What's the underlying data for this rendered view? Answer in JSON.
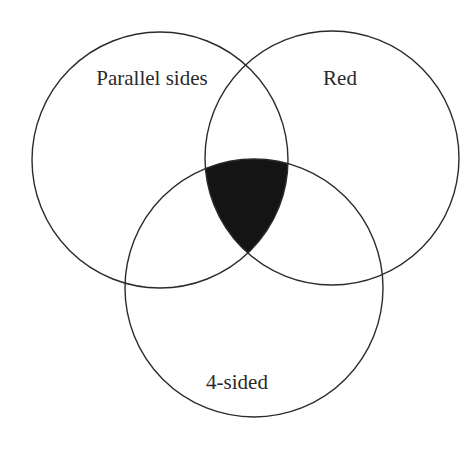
{
  "diagram": {
    "type": "venn",
    "sets": [
      {
        "id": "parallel",
        "label": "Parallel sides",
        "cx": 160,
        "cy": 160,
        "r": 128,
        "label_x": 152,
        "label_y": 85
      },
      {
        "id": "red",
        "label": "Red",
        "cx": 332,
        "cy": 158,
        "r": 127,
        "label_x": 340,
        "label_y": 85
      },
      {
        "id": "foursided",
        "label": "4-sided",
        "cx": 254,
        "cy": 288,
        "r": 129,
        "label_x": 237,
        "label_y": 389
      }
    ],
    "shaded_region": {
      "description": "Intersection of all three sets (Parallel sides ∩ Red ∩ 4-sided)",
      "color": "#141414"
    },
    "stroke_color": "#2b2b2b",
    "background": "#ffffff"
  }
}
